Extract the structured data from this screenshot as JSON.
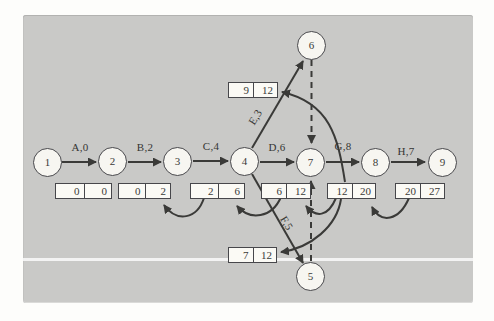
{
  "figure": {
    "nodes": [
      "1",
      "2",
      "3",
      "4",
      "5",
      "6",
      "7",
      "8",
      "9"
    ],
    "activities": {
      "A": "A,0",
      "B": "B,2",
      "C": "C,4",
      "D": "D,6",
      "E": "E,3",
      "F": "F,5",
      "G": "G,8",
      "H": "H,7"
    },
    "time_boxes": {
      "A": [
        "0",
        "0"
      ],
      "B": [
        "0",
        "2"
      ],
      "C": [
        "2",
        "6"
      ],
      "D": [
        "6",
        "12"
      ],
      "E": [
        "9",
        "12"
      ],
      "F": [
        "7",
        "12"
      ],
      "G": [
        "12",
        "20"
      ],
      "H": [
        "20",
        "27"
      ]
    },
    "colors": {
      "panel_background": "#c9c9c7",
      "line": "#3a3a38",
      "node_fill": "#f7f6f1",
      "box_fill": "#fbfaf5"
    }
  }
}
